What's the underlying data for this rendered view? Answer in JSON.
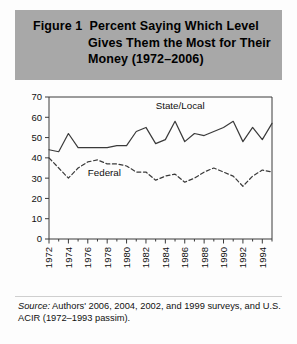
{
  "figure": {
    "title_lines": [
      "Figure 1  Percent Saying Which Level",
      "Gives Them the Most for Their",
      "Money (1972–2006)"
    ],
    "source_label": "Source:",
    "source_text": " Authors' 2006, 2004, 2002, and 1999 surveys, and U.S. ACIR (1972–1993 passim).",
    "band_color": "#a8a8a8",
    "line_color": "#3a3a3a"
  },
  "chart_data": {
    "type": "line",
    "title": "Figure 1  Percent Saying Which Level Gives Them the Most for Their Money (1972–2006)",
    "xlabel": "",
    "ylabel": "",
    "ylim": [
      0,
      70
    ],
    "yticks": [
      0,
      10,
      20,
      30,
      40,
      50,
      60,
      70
    ],
    "ytick_labels": [
      "0",
      "10",
      "20",
      "30",
      "40",
      "50",
      "60",
      "70"
    ],
    "xlim": [
      1972,
      1995
    ],
    "xticks": [
      1972,
      1974,
      1976,
      1978,
      1980,
      1982,
      1984,
      1986,
      1988,
      1990,
      1992,
      1994
    ],
    "xtick_labels": [
      "1972",
      "1974",
      "1976",
      "1978",
      "1980",
      "1982",
      "1984",
      "1986",
      "1988",
      "1990",
      "1992",
      "1994"
    ],
    "minor_xticks": [
      1973,
      1975,
      1977,
      1979,
      1981,
      1983,
      1985,
      1987,
      1989,
      1991,
      1993,
      1995
    ],
    "grid": false,
    "legend": "inline-labels",
    "x": [
      1972,
      1973,
      1974,
      1975,
      1976,
      1977,
      1978,
      1979,
      1980,
      1981,
      1982,
      1983,
      1984,
      1985,
      1986,
      1987,
      1988,
      1989,
      1990,
      1991,
      1992,
      1993,
      1994,
      1995
    ],
    "series": [
      {
        "name": "State/Local",
        "style": "solid",
        "label_x": 1983,
        "label_y": 64,
        "values": [
          44,
          43,
          52,
          45,
          45,
          45,
          45,
          46,
          46,
          53,
          55,
          47,
          49,
          58,
          48,
          52,
          51,
          53,
          55,
          58,
          48,
          55,
          49,
          57
        ]
      },
      {
        "name": "Federal",
        "style": "dashed",
        "label_x": 1976,
        "label_y": 31,
        "values": [
          40,
          35,
          30,
          35,
          38,
          39,
          37,
          37,
          36,
          33,
          33,
          29,
          31,
          32,
          28,
          30,
          33,
          35,
          33,
          31,
          26,
          31,
          34,
          33
        ]
      }
    ]
  }
}
